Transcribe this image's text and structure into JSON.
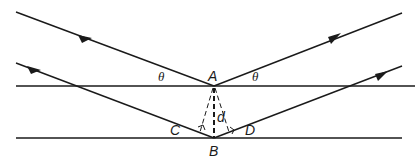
{
  "diagram": {
    "colors": {
      "line": "#1a1a1a",
      "background": "#ffffff"
    },
    "labels": {
      "A": "A",
      "B": "B",
      "C": "C",
      "D": "D",
      "d": "d",
      "theta_left": "θ",
      "theta_right": "θ"
    },
    "planes": [
      {
        "name": "upper-plane",
        "y": 86,
        "x1": 16,
        "x2": 415
      },
      {
        "name": "lower-plane",
        "y": 138,
        "x1": 16,
        "x2": 402
      }
    ],
    "points": {
      "A": [
        214,
        86
      ],
      "B": [
        214,
        138
      ],
      "C": [
        201,
        132
      ],
      "D": [
        229,
        131
      ]
    }
  }
}
